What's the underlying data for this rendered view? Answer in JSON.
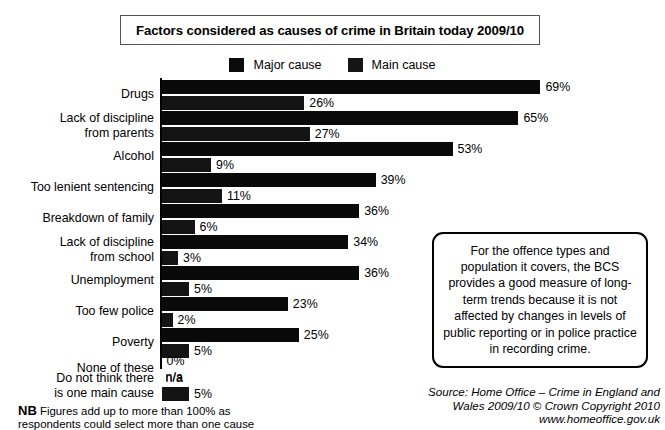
{
  "title": {
    "text": "Factors considered as causes of crime in Britain today 2009/10"
  },
  "legend": {
    "items": [
      {
        "label": "Major cause",
        "color": "#0a0a0a",
        "swatch": "legend-swatch-major"
      },
      {
        "label": "Main cause",
        "color": "#141414",
        "swatch": "legend-swatch-main"
      }
    ]
  },
  "callout": {
    "text": "For the offence types and population it covers, the BCS provides a good measure of long-term trends because it is not affected by changes in levels of public reporting or in police practice in recording crime."
  },
  "source": {
    "line1": "Source: Home Office – Crime in England and",
    "line2": "Wales 2009/10 © Crown Copyright 2010",
    "url": "www.homeoffice.gov.uk"
  },
  "footnote": {
    "nb": "NB",
    "text": " Figures add up to more than 100% as",
    "line2": "respondents could select more than one cause"
  },
  "chart_data": {
    "type": "bar",
    "orientation": "horizontal",
    "title": "Factors considered as causes of crime in Britain today 2009/10",
    "xlabel": "",
    "ylabel": "",
    "xlim": [
      0,
      69
    ],
    "grid": false,
    "legend_position": "top-center",
    "categories": [
      "Drugs",
      "Lack of discipline\nfrom parents",
      "Alcohol",
      "Too lenient sentencing",
      "Breakdown of family",
      "Lack of discipline\nfrom school",
      "Unemployment",
      "Too few police",
      "Poverty",
      "None of these",
      "Do not think there\nis one main cause"
    ],
    "series": [
      {
        "name": "Major cause",
        "values": [
          69,
          65,
          53,
          39,
          36,
          34,
          36,
          23,
          25,
          0,
          null
        ],
        "labels": [
          "69%",
          "65%",
          "53%",
          "39%",
          "36%",
          "34%",
          "36%",
          "23%",
          "25%",
          "0%",
          "n/a"
        ]
      },
      {
        "name": "Main cause",
        "values": [
          26,
          27,
          9,
          11,
          6,
          3,
          5,
          2,
          5,
          null,
          5
        ],
        "labels": [
          "26%",
          "27%",
          "9%",
          "11%",
          "6%",
          "3%",
          "5%",
          "2%",
          "5%",
          "n/a",
          "5%"
        ]
      }
    ]
  }
}
